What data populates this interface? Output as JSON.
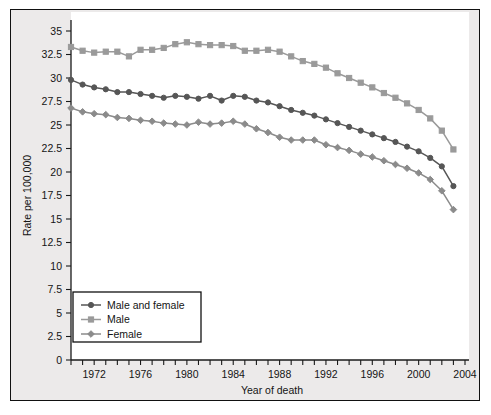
{
  "figure": {
    "background_color": "#ffffff",
    "panel_color": "#eceaea",
    "plot_color": "#ffffff",
    "border_color": "#111111"
  },
  "chart_data": {
    "type": "line",
    "title": "",
    "subtitle": "",
    "xlabel": "Year of death",
    "ylabel": "Rate per 100,000",
    "xlim": [
      1970,
      2004
    ],
    "ylim": [
      0,
      35
    ],
    "ytick_step": 2.5,
    "xtick_step": 1,
    "xtick_label_step": 4,
    "grid": false,
    "legend_position": "lower-left-inside",
    "ytick_labels": [
      "0",
      "2.5",
      "5",
      "7.5",
      "10",
      "12.5",
      "15",
      "17.5",
      "20",
      "22.5",
      "25",
      "27.5",
      "30",
      "32.5",
      "35"
    ],
    "ytick_values": [
      0,
      2.5,
      5,
      7.5,
      10,
      12.5,
      15,
      17.5,
      20,
      22.5,
      25,
      27.5,
      30,
      32.5,
      35
    ],
    "xtick_labels": [
      "1972",
      "1976",
      "1980",
      "1984",
      "1988",
      "1992",
      "1996",
      "2000",
      "2004"
    ],
    "xtick_label_values": [
      1972,
      1976,
      1980,
      1984,
      1988,
      1992,
      1996,
      2000,
      2004
    ],
    "x": [
      1970,
      1971,
      1972,
      1973,
      1974,
      1975,
      1976,
      1977,
      1978,
      1979,
      1980,
      1981,
      1982,
      1983,
      1984,
      1985,
      1986,
      1987,
      1988,
      1989,
      1990,
      1991,
      1992,
      1993,
      1994,
      1995,
      1996,
      1997,
      1998,
      1999,
      2000,
      2001,
      2002,
      2003
    ],
    "series": [
      {
        "name": "Male and female",
        "color": "#565656",
        "marker": "circle",
        "values": [
          29.8,
          29.3,
          29.0,
          28.8,
          28.5,
          28.5,
          28.3,
          28.1,
          27.9,
          28.1,
          28.0,
          27.8,
          28.1,
          27.6,
          28.1,
          28.0,
          27.6,
          27.4,
          27.0,
          26.6,
          26.3,
          26.0,
          25.6,
          25.2,
          24.8,
          24.4,
          24.0,
          23.6,
          23.2,
          22.7,
          22.2,
          21.5,
          20.6,
          18.5
        ]
      },
      {
        "name": "Male",
        "color": "#9a9a9a",
        "marker": "square",
        "values": [
          33.3,
          32.9,
          32.7,
          32.8,
          32.8,
          32.3,
          33.0,
          33.0,
          33.2,
          33.6,
          33.8,
          33.6,
          33.5,
          33.5,
          33.4,
          32.9,
          32.9,
          33.0,
          32.8,
          32.3,
          31.8,
          31.5,
          31.1,
          30.5,
          30.0,
          29.5,
          29.0,
          28.4,
          27.9,
          27.3,
          26.6,
          25.7,
          24.4,
          22.4
        ]
      },
      {
        "name": "Female",
        "color": "#8b8b8b",
        "marker": "diamond",
        "values": [
          26.8,
          26.4,
          26.2,
          26.1,
          25.8,
          25.7,
          25.5,
          25.4,
          25.2,
          25.1,
          25.0,
          25.3,
          25.1,
          25.2,
          25.4,
          25.1,
          24.6,
          24.2,
          23.7,
          23.4,
          23.4,
          23.4,
          22.9,
          22.6,
          22.3,
          21.9,
          21.6,
          21.2,
          20.8,
          20.4,
          19.9,
          19.2,
          18.0,
          16.0
        ]
      }
    ]
  },
  "legend": {
    "items": [
      {
        "label": "Male and female"
      },
      {
        "label": "Male"
      },
      {
        "label": "Female"
      }
    ]
  }
}
